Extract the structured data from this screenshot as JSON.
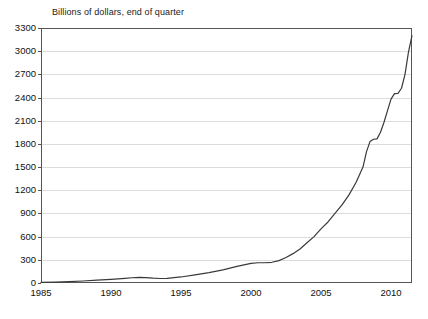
{
  "chart_data": {
    "type": "line",
    "title": "Billions of dollars, end of quarter",
    "subtitle": "",
    "xlabel": "",
    "ylabel": "",
    "xlim": [
      1985,
      2011.5
    ],
    "ylim": [
      0,
      3300
    ],
    "grid": true,
    "legend": false,
    "legend_position": "none",
    "y_ticks": [
      3300,
      3000,
      2700,
      2400,
      2100,
      1800,
      1500,
      1200,
      900,
      600,
      300,
      0
    ],
    "y_tick_labels": [
      "3300",
      "3000",
      "2700",
      "2400",
      "2100",
      "1800",
      "1500",
      "1200",
      "900",
      "600",
      "300",
      "0"
    ],
    "x_ticks": [
      1985,
      1990,
      1995,
      2000,
      2005,
      2010
    ],
    "x_tick_labels": [
      "1985",
      "1990",
      "1995",
      "2000",
      "2005",
      "2010"
    ],
    "line_color": "#3a3a3a",
    "axis_color": "#555555",
    "grid_color": "#dcdcdc",
    "series": [
      {
        "name": "Total",
        "x": [
          1985.0,
          1986.0,
          1987.0,
          1988.0,
          1989.0,
          1990.0,
          1991.0,
          1991.5,
          1992.0,
          1992.5,
          1993.0,
          1993.5,
          1994.0,
          1995.0,
          1996.0,
          1997.0,
          1998.0,
          1999.0,
          2000.0,
          2000.5,
          2001.0,
          2001.5,
          2002.0,
          2002.5,
          2003.0,
          2003.5,
          2004.0,
          2004.5,
          2005.0,
          2005.5,
          2006.0,
          2006.5,
          2007.0,
          2007.5,
          2008.0,
          2008.25,
          2008.5,
          2008.75,
          2009.0,
          2009.25,
          2009.5,
          2009.75,
          2010.0,
          2010.25,
          2010.5,
          2010.75,
          2011.0,
          2011.25,
          2011.5
        ],
        "values": [
          8,
          12,
          18,
          26,
          38,
          48,
          60,
          68,
          72,
          70,
          62,
          58,
          60,
          78,
          105,
          135,
          170,
          215,
          255,
          262,
          262,
          268,
          290,
          330,
          380,
          440,
          520,
          600,
          700,
          790,
          900,
          1010,
          1140,
          1300,
          1500,
          1700,
          1830,
          1860,
          1865,
          1950,
          2080,
          2230,
          2380,
          2450,
          2455,
          2520,
          2700,
          2990,
          3200
        ]
      }
    ],
    "annotations": []
  },
  "axes": {
    "plot_left_px": 41,
    "plot_right_px": 412,
    "plot_top_px": 28,
    "plot_bottom_px": 283
  }
}
